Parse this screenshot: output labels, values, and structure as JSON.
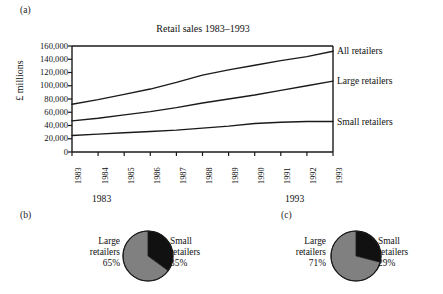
{
  "figure": {
    "panel_a_letter": "(a)",
    "panel_b_letter": "(b)",
    "panel_c_letter": "(c)"
  },
  "colors": {
    "line": "#1a1a1a",
    "text": "#111111",
    "pie_large": "#808080",
    "pie_small": "#111111",
    "pie_outline": "#1a1a1a",
    "background": "#ffffff"
  },
  "chart_data": [
    {
      "type": "line",
      "title": "Retail sales 1983–1993",
      "xlabel": "",
      "ylabel": "£ millions",
      "x": [
        "1983",
        "1984",
        "1985",
        "1986",
        "1987",
        "1988",
        "1989",
        "1990",
        "1991",
        "1992",
        "1993"
      ],
      "xticklabels": [
        "1983",
        "1984",
        "1985",
        "1986",
        "1987",
        "1988",
        "1989",
        "1990",
        "1991",
        "1992",
        "1993"
      ],
      "x_group_labels": [
        "1983",
        "1993"
      ],
      "yticklabels": [
        "160,000",
        "140,000",
        "120,000",
        "100,000",
        "80,000",
        "60,000",
        "40,000",
        "20,000",
        "0"
      ],
      "ylim": [
        0,
        160000
      ],
      "ytick_values": [
        160000,
        140000,
        120000,
        100000,
        80000,
        60000,
        40000,
        20000,
        0
      ],
      "grid": false,
      "legend_position": "right-of-axis-inline",
      "series": [
        {
          "name": "All retailers",
          "values": [
            72000,
            79000,
            87000,
            95000,
            105000,
            116000,
            124000,
            131000,
            138000,
            144000,
            152000
          ]
        },
        {
          "name": "Large retailers",
          "values": [
            47000,
            51000,
            56000,
            61000,
            67000,
            74000,
            80000,
            86000,
            93000,
            100000,
            107000
          ]
        },
        {
          "name": "Small retailers",
          "values": [
            25000,
            27000,
            29000,
            31000,
            33000,
            36000,
            39000,
            43000,
            45000,
            46000,
            46000
          ]
        }
      ]
    },
    {
      "type": "pie",
      "title": "(b)",
      "labels": [
        "Large retailers",
        "Small retailers"
      ],
      "values": [
        65,
        29
      ],
      "slices": [
        {
          "label": "Large retailers",
          "percent": "65%",
          "value": 65,
          "color": "#808080"
        },
        {
          "label": "Small retailers",
          "percent": "35%",
          "value": 35,
          "color": "#111111"
        }
      ]
    },
    {
      "type": "pie",
      "title": "(c)",
      "labels": [
        "Large retailers",
        "Small retailers"
      ],
      "values": [
        71,
        29
      ],
      "slices": [
        {
          "label": "Large retailers",
          "percent": "71%",
          "value": 71,
          "color": "#808080"
        },
        {
          "label": "Small retailers",
          "percent": "29%",
          "value": 29,
          "color": "#111111"
        }
      ]
    }
  ],
  "panel_b": {
    "left_label_name": "Large",
    "left_label_name2": "retailers",
    "left_label_pct": "65%",
    "right_label_name": "Small",
    "right_label_name2": "retailers",
    "right_label_pct": "35%"
  },
  "panel_c": {
    "left_label_name": "Large",
    "left_label_name2": "retailers",
    "left_label_pct": "71%",
    "right_label_name": "Small",
    "right_label_name2": "retailers",
    "right_label_pct": "29%"
  }
}
